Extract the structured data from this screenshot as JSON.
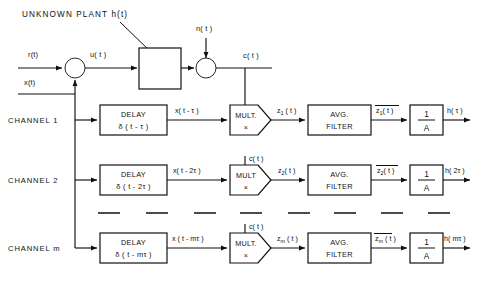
{
  "figure": {
    "title": "UNKNOWN PLANT  h(t)",
    "type": "block-diagram"
  },
  "top_path": {
    "input_r": "r(t)",
    "input_x": "x(t)",
    "sum1_output": "u( t )",
    "noise_input": "n( t )",
    "plant_label": "UNKNOWN PLANT",
    "plant_impulse": "h(t)",
    "plant_output": "c( t )"
  },
  "channels": [
    {
      "name": "CHANNEL 1",
      "delay_title": "DELAY",
      "delay_expr": "δ ( t - τ )",
      "delay_out": "x( t - τ )",
      "mult_title": "MULT.",
      "mult_symbol": "×",
      "mult_input": "c( t )",
      "mult_out_base": "z",
      "mult_out_sub": "1",
      "mult_out_tail": " ( t )",
      "filter_line1": "AVG.",
      "filter_line2": "FILTER",
      "filter_out_base": "z",
      "filter_out_sub": "1",
      "filter_out_tail": "( t )",
      "gain_num": "1",
      "gain_den": "A",
      "output": "h( τ )"
    },
    {
      "name": "CHANNEL 2",
      "delay_title": "DELAY",
      "delay_expr": "δ ( t - 2τ )",
      "delay_out": "x( t - 2τ )",
      "mult_title": "MULT",
      "mult_symbol": "×",
      "mult_input": "c( t )",
      "mult_out_base": "z",
      "mult_out_sub": "2",
      "mult_out_tail": "( t )",
      "filter_line1": "AVG.",
      "filter_line2": "FILTER",
      "filter_out_base": "z",
      "filter_out_sub": "2",
      "filter_out_tail": "( t )",
      "gain_num": "1",
      "gain_den": "A",
      "output": "h( 2τ )"
    },
    {
      "name": "CHANNEL m",
      "delay_title": "DELAY",
      "delay_expr": "δ ( t - mτ )",
      "delay_out": "x ( t - mτ )",
      "mult_title": "MULT.",
      "mult_symbol": "×",
      "mult_input": "c( t )",
      "mult_out_base": "z",
      "mult_out_sub": "m",
      "mult_out_tail": " ( t )",
      "filter_line1": "AVG.",
      "filter_line2": "FILTER",
      "filter_out_base": "z",
      "filter_out_sub": "m",
      "filter_out_tail": " ( t )",
      "gain_num": "1",
      "gain_den": "A",
      "output": "h( mτ )"
    }
  ],
  "ellipsis": {
    "symbol": "—",
    "count": 8
  },
  "colors": {
    "ink": "#111111",
    "paper": "#ffffff"
  }
}
